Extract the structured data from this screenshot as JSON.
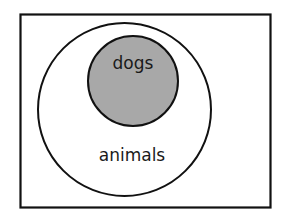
{
  "diagram": {
    "type": "euler-diagram",
    "universe": {
      "label": ""
    },
    "sets": [
      {
        "id": "animals",
        "label": "animals",
        "fill": "#ffffff",
        "contains": [
          "dogs"
        ]
      },
      {
        "id": "dogs",
        "label": "dogs",
        "fill": "#a8a8a8",
        "contains": []
      }
    ]
  },
  "colors": {
    "stroke": "#111111",
    "background": "#ffffff",
    "inner_fill": "#a8a8a8"
  }
}
